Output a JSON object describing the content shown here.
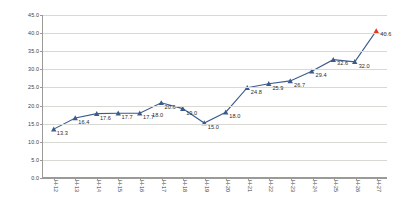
{
  "chart_data": {
    "type": "line",
    "title": "",
    "subtitle": "",
    "xlabel": "",
    "ylabel": "",
    "ylim": [
      0.0,
      45.0
    ],
    "ytick_step": 5.0,
    "grid": true,
    "legend": "none",
    "categories": [
      "H-12",
      "H-13",
      "H-14",
      "H-15",
      "H-16",
      "H-17",
      "H-18",
      "H-19",
      "H-20",
      "H-21",
      "H-22",
      "H-23",
      "H-24",
      "H-25",
      "H-26",
      "H-27"
    ],
    "ytick_labels": [
      "0.0",
      "5.0",
      "10.0",
      "15.0",
      "20.0",
      "25.0",
      "30.0",
      "35.0",
      "40.0",
      "45.0"
    ],
    "series": [
      {
        "name": "actual",
        "color": "#3b5b8c",
        "marker": "triangle",
        "values": [
          13.3,
          16.4,
          17.6,
          17.7,
          17.7,
          20.6,
          19.0,
          15.0,
          18.0,
          24.8,
          25.9,
          26.7,
          29.4,
          32.6,
          32.0,
          40.6
        ]
      }
    ],
    "point_labels": [
      "13.3",
      "16.4",
      "17.6",
      "17.7",
      "17.7",
      "20.6",
      "19.0",
      "15.0",
      "18.0",
      "24.8",
      "25.9",
      "26.7",
      "29.4",
      "32.6",
      "32.0",
      "40.6"
    ],
    "extra_point_label": "18.0",
    "highlight": {
      "category": "H-27",
      "value": 40.6,
      "label": "40.6",
      "color": "#e03c1f"
    },
    "colors": {
      "line": "#3b5b8c",
      "marker": "#3b5b8c",
      "highlight": "#e03c1f",
      "grid": "#d9d9d4",
      "axis": "#9a9a96",
      "text": "#3d3d3d",
      "background": "#ffffff"
    }
  }
}
